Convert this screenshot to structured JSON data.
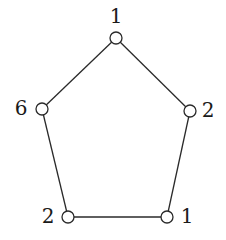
{
  "diagram": {
    "type": "cycle-graph",
    "nodes": [
      {
        "id": "top",
        "label": "1",
        "cx": 116,
        "cy": 38,
        "lx": 116,
        "ly": 16
      },
      {
        "id": "right",
        "label": "2",
        "cx": 190,
        "cy": 111,
        "lx": 208,
        "ly": 110
      },
      {
        "id": "bottom-right",
        "label": "1",
        "cx": 167,
        "cy": 217,
        "lx": 187,
        "ly": 216
      },
      {
        "id": "bottom-left",
        "label": "2",
        "cx": 68,
        "cy": 217,
        "lx": 48,
        "ly": 216
      },
      {
        "id": "left",
        "label": "6",
        "cx": 42,
        "cy": 109,
        "lx": 21,
        "ly": 108
      }
    ],
    "edges": [
      [
        "top",
        "right"
      ],
      [
        "right",
        "bottom-right"
      ],
      [
        "bottom-right",
        "bottom-left"
      ],
      [
        "bottom-left",
        "left"
      ],
      [
        "left",
        "top"
      ]
    ],
    "node_radius": 6,
    "colors": {
      "stroke": "#2a2a2a",
      "node_fill": "#ffffff",
      "text": "#1a1a1a"
    }
  }
}
